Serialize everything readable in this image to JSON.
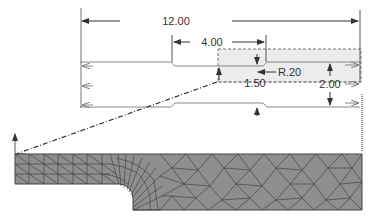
{
  "drawing": {
    "dimensions": {
      "overall_length": "12.00",
      "gauge_length": "4.00",
      "fillet_radius": "R.20",
      "half_width": "1.50",
      "full_width": "2.00"
    },
    "colors": {
      "line": "#555555",
      "highlight_region": "#ececec",
      "mesh_fill": "#8e8e8e",
      "mesh_edge": "#3a3a3a"
    }
  },
  "mesh": {
    "label": "finite element mesh of quarter model"
  }
}
